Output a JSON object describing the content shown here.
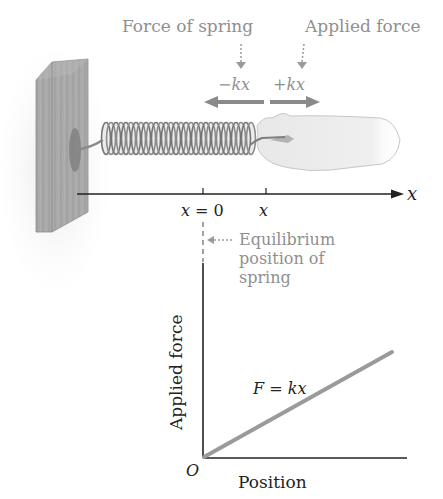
{
  "annotations": {
    "force_of_spring": "Force of spring",
    "applied_force": "Applied force",
    "neg_kx": "−kx",
    "pos_kx": "+kx",
    "equilibrium_line1": "Equilibrium",
    "equilibrium_line2": "position of",
    "equilibrium_line3": "spring"
  },
  "axis": {
    "label": "x",
    "tick_zero": "x = 0",
    "tick_x": "x"
  },
  "graph": {
    "ylabel": "Applied force",
    "xlabel": "Position",
    "origin": "O",
    "line_label": "F = kx"
  },
  "colors": {
    "annotation_gray": "#8f8f8f",
    "arrow_gray": "#8a8a8a",
    "line_gray": "#9a9a9a",
    "axis_dark": "#222222",
    "wall_fill": "#a8a8a8",
    "hand_fill": "#ededed"
  }
}
